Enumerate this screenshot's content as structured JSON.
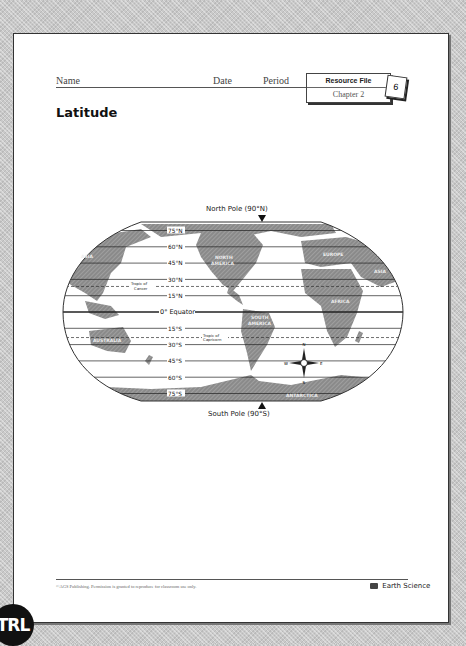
{
  "header": {
    "name_label": "Name",
    "date_label": "Date",
    "period_label": "Period",
    "resource_file": "Resource File",
    "chapter": "Chapter 2",
    "page_number": "6"
  },
  "title": "Latitude",
  "map": {
    "north_pole_label": "North Pole (90°N)",
    "south_pole_label": "South Pole (90°S)",
    "latitudes": [
      {
        "label": "75°N",
        "lat": 75
      },
      {
        "label": "60°N",
        "lat": 60
      },
      {
        "label": "45°N",
        "lat": 45
      },
      {
        "label": "30°N",
        "lat": 30
      },
      {
        "label": "15°N",
        "lat": 15
      },
      {
        "label": "0° Equator",
        "lat": 0
      },
      {
        "label": "15°S",
        "lat": -15
      },
      {
        "label": "30°S",
        "lat": -30
      },
      {
        "label": "45°S",
        "lat": -45
      },
      {
        "label": "60°S",
        "lat": -60
      },
      {
        "label": "75°S",
        "lat": -75
      }
    ],
    "tropics": [
      {
        "label_line1": "Tropic of",
        "label_line2": "Cancer",
        "lat": 23.5
      },
      {
        "label_line1": "Tropic of",
        "label_line2": "Capricorn",
        "lat": -23.5
      }
    ],
    "continents": [
      "ASIA",
      "NORTH AMERICA",
      "EUROPE",
      "ASIA",
      "AFRICA",
      "SOUTH AMERICA",
      "AUSTRALIA",
      "ANTARCTICA"
    ],
    "compass": {
      "n": "N",
      "s": "S",
      "e": "E",
      "w": "W"
    }
  },
  "footer": {
    "copyright": "©AGS Publishing. Permission is granted to reproduce for classroom use only.",
    "brand": "Earth Science"
  },
  "badge": "TRL"
}
